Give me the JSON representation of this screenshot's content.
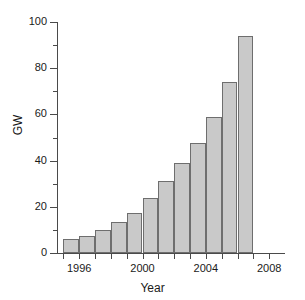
{
  "chart_data": {
    "type": "bar",
    "title": "",
    "subtitle": "",
    "xlabel": "Year",
    "ylabel": "GW",
    "categories": [
      1995,
      1996,
      1997,
      1998,
      1999,
      2000,
      2001,
      2002,
      2003,
      2004,
      2005,
      2006
    ],
    "values": [
      6,
      7.5,
      10,
      13.5,
      17.5,
      24,
      31,
      39,
      47.5,
      59,
      74,
      94
    ],
    "series": [
      {
        "name": "GW",
        "values": [
          6,
          7.5,
          10,
          13.5,
          17.5,
          24,
          31,
          39,
          47.5,
          59,
          74,
          94
        ]
      }
    ],
    "xlim": [
      1994.6,
      2009.0
    ],
    "ylim": [
      0,
      100
    ],
    "x_ticks": [
      1995,
      1996,
      1997,
      1998,
      1999,
      2000,
      2001,
      2002,
      2003,
      2004,
      2005,
      2006,
      2007,
      2008
    ],
    "x_tick_labels": [
      {
        "value": 1996,
        "label": "1996"
      },
      {
        "value": 2000,
        "label": "2000"
      },
      {
        "value": 2004,
        "label": "2004"
      },
      {
        "value": 2008,
        "label": "2008"
      }
    ],
    "y_ticks_major": [
      0,
      20,
      40,
      60,
      80,
      100
    ],
    "y_tick_labels": [
      "0",
      "20",
      "40",
      "60",
      "80",
      "100"
    ],
    "y_ticks_minor": [
      10,
      30,
      50,
      70,
      90
    ],
    "grid": false,
    "legend": false,
    "legend_position": "none",
    "bar_fill_color": "#c9c9c9",
    "bar_edge_color": "#6e6e6e",
    "axis_color": "#4a4a4a",
    "text_color": "#1a1a1a",
    "background_color": "#ffffff"
  }
}
